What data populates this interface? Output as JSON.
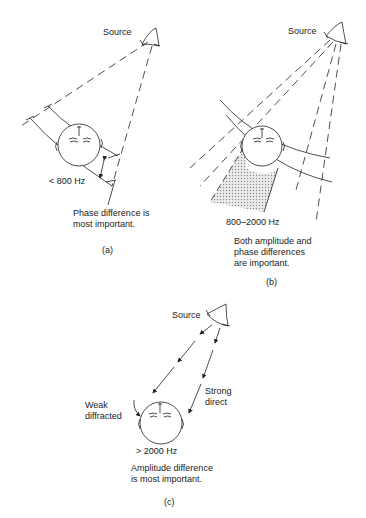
{
  "panels": [
    {
      "id": "a",
      "source_label": "Source",
      "frequency_label": "< 800 Hz",
      "description_lines": [
        "Phase difference is",
        "most important."
      ],
      "caption": "(a)"
    },
    {
      "id": "b",
      "source_label": "Source",
      "frequency_label": "800–2000 Hz",
      "description_lines": [
        "Both amplitude and",
        "phase differences",
        "are important."
      ],
      "caption": "(b)"
    },
    {
      "id": "c",
      "source_label": "Source",
      "frequency_label": "> 2000 Hz",
      "weak_label_lines": [
        "Weak",
        "diffracted"
      ],
      "strong_label_lines": [
        "Strong",
        "direct"
      ],
      "description_lines": [
        "Amplitude difference",
        "is most important."
      ],
      "caption": "(c)"
    }
  ],
  "colors": {
    "line": "#222222",
    "shade": "#bdbdbd",
    "background": "#ffffff"
  }
}
